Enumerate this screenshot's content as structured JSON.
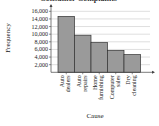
{
  "chart_data": {
    "type": "bar",
    "title": "Consumer Complaints",
    "xlabel": "Cause",
    "ylabel": "Frequency",
    "categories": [
      "Auto dealers",
      "Auto repairs",
      "Home furnishing",
      "Computer sales",
      "Dry cleaning"
    ],
    "category_lines": [
      [
        "Auto",
        "dealers"
      ],
      [
        "Auto",
        "repairs"
      ],
      [
        "Home",
        "furnishing"
      ],
      [
        "Computer",
        "sales"
      ],
      [
        "Dry",
        "cleaning"
      ]
    ],
    "values": [
      14668,
      9728,
      7792,
      5733,
      4649
    ],
    "yticks": [
      2000,
      4000,
      6000,
      8000,
      10000,
      12000,
      14000,
      16000
    ],
    "ytick_labels": [
      "2,000",
      "4,000",
      "6,000",
      "8,000",
      "10,000",
      "12,000",
      "14,000",
      "16,000"
    ],
    "ylim": [
      0,
      16000
    ],
    "grid": true,
    "bar_color": "#9a9a9a",
    "legend": null
  }
}
